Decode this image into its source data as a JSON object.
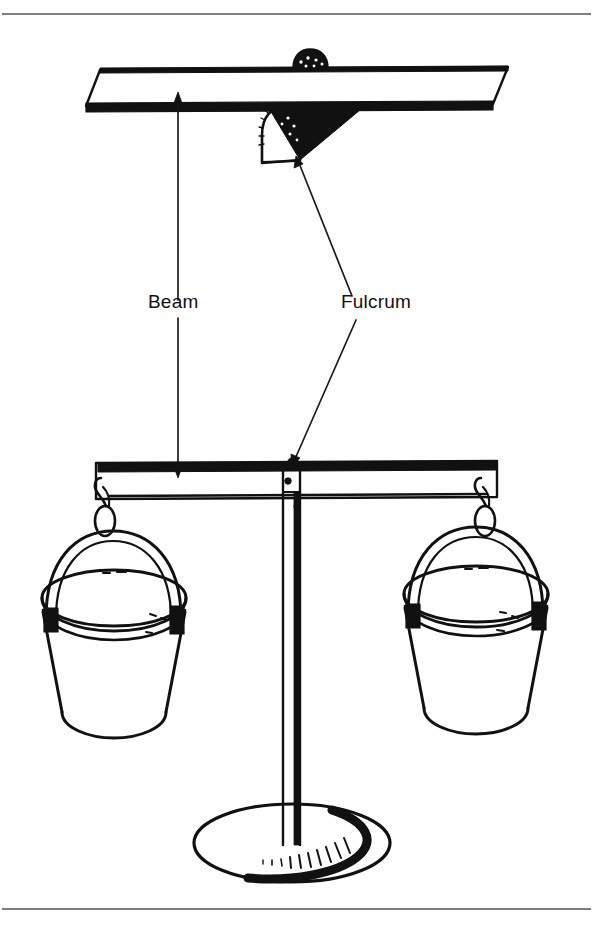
{
  "figure": {
    "background_color": "#ffffff",
    "ink_color": "#111111",
    "rule_color": "#555555",
    "width": 593,
    "height": 942
  },
  "frame": {
    "top_rule_y": 14,
    "bottom_rule_y": 909,
    "has_side_borders": false
  },
  "labels": [
    {
      "id": "beam",
      "text": "Beam",
      "x": 148,
      "y": 308,
      "anchor": "start",
      "leader_up": "M 178,300 L 178,96",
      "leader_down": "M 178,318 L 178,478"
    },
    {
      "id": "fulcrum",
      "text": "Fulcrum",
      "x": 341,
      "y": 308,
      "anchor": "start",
      "leader_up": "M 352,296 L 297,160",
      "leader_down": "M 356,320 L 293,462"
    }
  ],
  "parts": {
    "upper_beam_label": "beam-plank-perspective",
    "fulcrum_label": "fulcrum-wedge",
    "lower_beam_label": "balance-beam",
    "post_label": "center-post",
    "base_label": "base-plate",
    "left_bucket_label": "left-bucket",
    "right_bucket_label": "right-bucket",
    "left_hook_label": "left-s-hook",
    "right_hook_label": "right-s-hook",
    "pivot_label": "pivot-point"
  },
  "annotations": {
    "beam_callout": "Beam",
    "fulcrum_callout": "Fulcrum"
  }
}
